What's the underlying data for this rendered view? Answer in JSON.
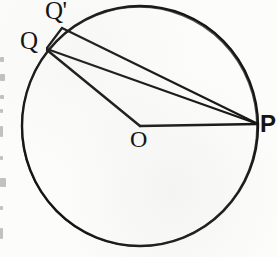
{
  "figure": {
    "kind": "geometry-diagram",
    "background_color": "#fcfcfb",
    "stroke_color": "#151515",
    "canvas": {
      "width": 277,
      "height": 257
    },
    "circle": {
      "name": "main-circle",
      "center_x": 140,
      "center_y": 126,
      "radius": 118,
      "stroke_width": 2.4
    },
    "points": [
      {
        "id": "Q",
        "label": "Q",
        "x": 47,
        "y": 48,
        "label_x": 20,
        "label_y": 28
      },
      {
        "id": "Qprime",
        "label": "Q'",
        "x": 62,
        "y": 28,
        "label_x": 45,
        "label_y": -2
      },
      {
        "id": "O",
        "label": "O",
        "x": 140,
        "y": 126,
        "label_x": 130,
        "label_y": 127
      },
      {
        "id": "P",
        "label": "P",
        "x": 258,
        "y": 124,
        "label_x": 260,
        "label_y": 112
      }
    ],
    "segments": [
      {
        "name": "segment-q-qprime",
        "from": "Q",
        "to": "Qprime",
        "x1": 47,
        "y1": 48,
        "x2": 62,
        "y2": 28,
        "stroke_width": 2.2
      },
      {
        "name": "segment-qprime-p",
        "from": "Qprime",
        "to": "P",
        "x1": 62,
        "y1": 28,
        "x2": 258,
        "y2": 124,
        "stroke_width": 2.2
      },
      {
        "name": "segment-q-p",
        "from": "Q",
        "to": "P",
        "x1": 47,
        "y1": 49,
        "x2": 258,
        "y2": 124,
        "stroke_width": 2.2
      },
      {
        "name": "segment-q-o",
        "from": "Q",
        "to": "O",
        "x1": 47,
        "y1": 50,
        "x2": 140,
        "y2": 126,
        "stroke_width": 2.4
      },
      {
        "name": "segment-o-p",
        "from": "O",
        "to": "P",
        "x1": 140,
        "y1": 126,
        "x2": 258,
        "y2": 124,
        "stroke_width": 2.4
      }
    ],
    "margin_fragments": [
      {
        "top": 57,
        "height": 5,
        "width": 4
      },
      {
        "top": 74,
        "height": 7,
        "width": 5
      },
      {
        "top": 95,
        "height": 4,
        "width": 4
      },
      {
        "top": 109,
        "height": 4,
        "width": 3
      },
      {
        "top": 126,
        "height": 11,
        "width": 3
      },
      {
        "top": 156,
        "height": 4,
        "width": 3
      },
      {
        "top": 178,
        "height": 9,
        "width": 6
      },
      {
        "top": 206,
        "height": 4,
        "width": 3
      },
      {
        "top": 228,
        "height": 11,
        "width": 3
      }
    ]
  }
}
